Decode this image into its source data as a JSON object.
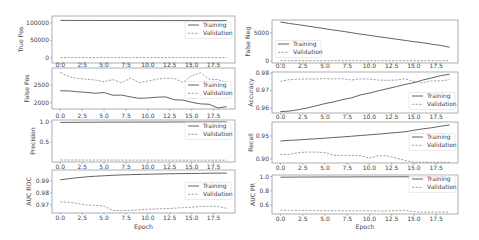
{
  "figure": {
    "colors": {
      "training": "#3a3a3a",
      "validation": "#8a8a8a"
    },
    "xlabel": "Epoch"
  },
  "chart_data": [
    {
      "type": "line",
      "title": "",
      "ylabel": "True Pos",
      "xlabel": "",
      "x": [
        0,
        1,
        2,
        3,
        4,
        5,
        6,
        7,
        8,
        9,
        10,
        11,
        12,
        13,
        14,
        15,
        16,
        17,
        18,
        19
      ],
      "xticks": [
        0,
        2.5,
        5,
        7.5,
        10,
        12.5,
        15,
        17.5
      ],
      "xtick_labels": [
        "0.0",
        "2.5",
        "5.0",
        "7.5",
        "10.0",
        "12.5",
        "15.0",
        "17.5"
      ],
      "yticks": [
        0,
        50000,
        100000
      ],
      "ytick_labels": [
        "0",
        "50000",
        "100000"
      ],
      "xlim": [
        -0.95,
        19.95
      ],
      "ylim": [
        -14300,
        120000
      ],
      "grid": false,
      "legend": {
        "position": "upper right",
        "entries": [
          "Training",
          "Validation"
        ]
      },
      "series": [
        {
          "name": "Training",
          "style": "solid",
          "values": [
            107500,
            107400,
            107300,
            107300,
            107200,
            107200,
            107100,
            107100,
            107100,
            107000,
            107000,
            107000,
            106900,
            106900,
            106900,
            106900,
            106800,
            106800,
            106800,
            106800
          ]
        },
        {
          "name": "Validation",
          "style": "dashed",
          "values": [
            1200,
            1200,
            1200,
            1200,
            1200,
            1200,
            1200,
            1200,
            1200,
            1200,
            1200,
            1200,
            1200,
            1200,
            1200,
            1200,
            1200,
            1200,
            1200,
            1200
          ]
        }
      ]
    },
    {
      "type": "line",
      "title": "",
      "ylabel": "False Neg",
      "xlabel": "",
      "x": [
        0,
        1,
        2,
        3,
        4,
        5,
        6,
        7,
        8,
        9,
        10,
        11,
        12,
        13,
        14,
        15,
        16,
        17,
        18,
        19
      ],
      "xticks": [
        0,
        2.5,
        5,
        7.5,
        10,
        12.5,
        15,
        17.5
      ],
      "xtick_labels": [
        "0.0",
        "2.5",
        "5.0",
        "7.5",
        "10.0",
        "12.5",
        "15.0",
        "17.5"
      ],
      "yticks": [
        0,
        5000
      ],
      "ytick_labels": [
        "0",
        "5000"
      ],
      "xlim": [
        -0.95,
        19.95
      ],
      "ylim": [
        -360,
        7320
      ],
      "grid": false,
      "legend": {
        "position": "lower left",
        "entries": [
          "Training",
          "Validation"
        ]
      },
      "series": [
        {
          "name": "Training",
          "style": "solid",
          "values": [
            6960,
            6700,
            6480,
            6250,
            6000,
            5760,
            5520,
            5300,
            5050,
            4800,
            4580,
            4340,
            4120,
            3900,
            3680,
            3450,
            3250,
            3000,
            2780,
            2450
          ]
        },
        {
          "name": "Validation",
          "style": "dashed",
          "values": [
            60,
            58,
            56,
            55,
            54,
            53,
            52,
            52,
            51,
            50,
            50,
            50,
            49,
            49,
            48,
            48,
            48,
            47,
            47,
            47
          ]
        }
      ]
    },
    {
      "type": "line",
      "title": "",
      "ylabel": "False Pos",
      "xlabel": "",
      "x": [
        0,
        1,
        2,
        3,
        4,
        5,
        6,
        7,
        8,
        9,
        10,
        11,
        12,
        13,
        14,
        15,
        16,
        17,
        18,
        19
      ],
      "xticks": [
        0,
        2.5,
        5,
        7.5,
        10,
        12.5,
        15,
        17.5
      ],
      "xtick_labels": [
        "0.0",
        "2.5",
        "5.0",
        "7.5",
        "10.0",
        "12.5",
        "15.0",
        "17.5"
      ],
      "yticks": [
        2000,
        2500
      ],
      "ytick_labels": [
        "2000",
        "2500"
      ],
      "xlim": [
        -0.95,
        19.95
      ],
      "ylim": [
        1833,
        2972
      ],
      "grid": false,
      "legend": {
        "position": "center right",
        "entries": [
          "Training",
          "Validation"
        ]
      },
      "series": [
        {
          "name": "Training",
          "style": "solid",
          "values": [
            2340,
            2335,
            2310,
            2295,
            2270,
            2290,
            2215,
            2220,
            2170,
            2130,
            2140,
            2160,
            2170,
            2090,
            2080,
            2020,
            1975,
            1965,
            1860,
            1900
          ]
        },
        {
          "name": "Validation",
          "style": "dashed",
          "values": [
            2850,
            2730,
            2680,
            2660,
            2640,
            2590,
            2650,
            2560,
            2690,
            2570,
            2610,
            2660,
            2690,
            2680,
            2570,
            2760,
            2840,
            2660,
            2650,
            2570
          ]
        }
      ]
    },
    {
      "type": "line",
      "title": "",
      "ylabel": "Accuracy",
      "xlabel": "",
      "x": [
        0,
        1,
        2,
        3,
        4,
        5,
        6,
        7,
        8,
        9,
        10,
        11,
        12,
        13,
        14,
        15,
        16,
        17,
        18,
        19
      ],
      "xticks": [
        0,
        2.5,
        5,
        7.5,
        10,
        12.5,
        15,
        17.5
      ],
      "xtick_labels": [
        "0.0",
        "2.5",
        "5.0",
        "7.5",
        "10.0",
        "12.5",
        "15.0",
        "17.5"
      ],
      "yticks": [
        0.96,
        0.97,
        0.98
      ],
      "ytick_labels": [
        "0.96",
        "0.97",
        "0.98"
      ],
      "xlim": [
        -0.95,
        19.95
      ],
      "ylim": [
        0.9571,
        0.9806
      ],
      "grid": false,
      "legend": {
        "position": "lower right",
        "entries": [
          "Training",
          "Validation"
        ]
      },
      "series": [
        {
          "name": "Training",
          "style": "solid",
          "values": [
            0.9579,
            0.9582,
            0.959,
            0.96,
            0.9612,
            0.9625,
            0.9635,
            0.9648,
            0.9658,
            0.9675,
            0.9685,
            0.9698,
            0.971,
            0.9722,
            0.9735,
            0.9745,
            0.976,
            0.9772,
            0.9785,
            0.9793
          ]
        },
        {
          "name": "Validation",
          "style": "dashed",
          "values": [
            0.9753,
            0.9762,
            0.9765,
            0.9766,
            0.9766,
            0.9768,
            0.9766,
            0.9768,
            0.976,
            0.9767,
            0.9765,
            0.976,
            0.9758,
            0.976,
            0.9767,
            0.9752,
            0.9745,
            0.9755,
            0.9755,
            0.9762
          ]
        }
      ]
    },
    {
      "type": "line",
      "title": "",
      "ylabel": "Precision",
      "xlabel": "",
      "x": [
        0,
        1,
        2,
        3,
        4,
        5,
        6,
        7,
        8,
        9,
        10,
        11,
        12,
        13,
        14,
        15,
        16,
        17,
        18,
        19
      ],
      "xticks": [
        0,
        2.5,
        5,
        7.5,
        10,
        12.5,
        15,
        17.5
      ],
      "xtick_labels": [
        "0.0",
        "2.5",
        "5.0",
        "7.5",
        "10.0",
        "12.5",
        "15.0",
        "17.5"
      ],
      "yticks": [
        0.5,
        1.0
      ],
      "ytick_labels": [
        "0.5",
        "1.0"
      ],
      "xlim": [
        -0.95,
        19.95
      ],
      "ylim": [
        0.0025,
        1.0475
      ],
      "grid": false,
      "legend": {
        "position": "upper right",
        "entries": [
          "Training",
          "Validation"
        ]
      },
      "series": [
        {
          "name": "Training",
          "style": "solid",
          "values": [
            0.986,
            0.989,
            0.991,
            0.992,
            0.993,
            0.994,
            0.995,
            0.995,
            0.996,
            0.996,
            0.997,
            0.997,
            0.997,
            0.998,
            0.998,
            0.998,
            0.998,
            0.999,
            0.999,
            0.999
          ]
        },
        {
          "name": "Validation",
          "style": "dashed",
          "values": [
            0.053,
            0.052,
            0.052,
            0.051,
            0.051,
            0.05,
            0.05,
            0.05,
            0.05,
            0.049,
            0.049,
            0.05,
            0.049,
            0.049,
            0.048,
            0.048,
            0.048,
            0.048,
            0.048,
            0.048
          ]
        }
      ]
    },
    {
      "type": "line",
      "title": "",
      "ylabel": "Recall",
      "xlabel": "",
      "x": [
        0,
        1,
        2,
        3,
        4,
        5,
        6,
        7,
        8,
        9,
        10,
        11,
        12,
        13,
        14,
        15,
        16,
        17,
        18,
        19
      ],
      "xticks": [
        0,
        2.5,
        5,
        7.5,
        10,
        12.5,
        15,
        17.5
      ],
      "xtick_labels": [
        "0.0",
        "2.5",
        "5.0",
        "7.5",
        "10.0",
        "12.5",
        "15.0",
        "17.5"
      ],
      "yticks": [
        0.9,
        0.95
      ],
      "ytick_labels": [
        "0.90",
        "0.95"
      ],
      "xlim": [
        -0.95,
        19.95
      ],
      "ylim": [
        0.8913,
        0.9804
      ],
      "grid": false,
      "legend": {
        "position": "center right",
        "entries": [
          "Training",
          "Validation"
        ]
      },
      "series": [
        {
          "name": "Training",
          "style": "solid",
          "values": [
            0.9391,
            0.9405,
            0.9415,
            0.9428,
            0.944,
            0.9452,
            0.9468,
            0.948,
            0.9495,
            0.951,
            0.9525,
            0.954,
            0.9558,
            0.9575,
            0.959,
            0.9625,
            0.9655,
            0.968,
            0.9712,
            0.9739
          ]
        },
        {
          "name": "Validation",
          "style": "dashed",
          "values": [
            0.91,
            0.91,
            0.914,
            0.915,
            0.915,
            0.914,
            0.908,
            0.908,
            0.908,
            0.907,
            0.902,
            0.907,
            0.907,
            0.902,
            0.897,
            0.893,
            0.893,
            0.893,
            0.893,
            0.893
          ]
        }
      ]
    },
    {
      "type": "line",
      "title": "",
      "ylabel": "AUC ROC",
      "xlabel": "Epoch",
      "x": [
        0,
        1,
        2,
        3,
        4,
        5,
        6,
        7,
        8,
        9,
        10,
        11,
        12,
        13,
        14,
        15,
        16,
        17,
        18,
        19
      ],
      "xticks": [
        0,
        2.5,
        5,
        7.5,
        10,
        12.5,
        15,
        17.5
      ],
      "xtick_labels": [
        "0.0",
        "2.5",
        "5.0",
        "7.5",
        "10.0",
        "12.5",
        "15.0",
        "17.5"
      ],
      "yticks": [
        0.97,
        0.98,
        0.99
      ],
      "ytick_labels": [
        "0.97",
        "0.98",
        "0.99"
      ],
      "xlim": [
        -0.95,
        19.95
      ],
      "ylim": [
        0.9633,
        0.9992
      ],
      "grid": false,
      "legend": {
        "position": "center right",
        "entries": [
          "Training",
          "Validation"
        ]
      },
      "series": [
        {
          "name": "Training",
          "style": "solid",
          "values": [
            0.991,
            0.992,
            0.9928,
            0.9935,
            0.994,
            0.9944,
            0.9948,
            0.9951,
            0.9953,
            0.9955,
            0.9957,
            0.9958,
            0.996,
            0.9961,
            0.9962,
            0.9963,
            0.9964,
            0.9965,
            0.9966,
            0.9966
          ]
        },
        {
          "name": "Validation",
          "style": "dashed",
          "values": [
            0.9725,
            0.9723,
            0.9712,
            0.97,
            0.9697,
            0.969,
            0.9655,
            0.9652,
            0.9655,
            0.966,
            0.9665,
            0.9667,
            0.967,
            0.9673,
            0.9678,
            0.9682,
            0.9687,
            0.969,
            0.9688,
            0.9672
          ]
        }
      ]
    },
    {
      "type": "line",
      "title": "",
      "ylabel": "AUC PR",
      "xlabel": "Epoch",
      "x": [
        0,
        1,
        2,
        3,
        4,
        5,
        6,
        7,
        8,
        9,
        10,
        11,
        12,
        13,
        14,
        15,
        16,
        17,
        18,
        19
      ],
      "xticks": [
        0,
        2.5,
        5,
        7.5,
        10,
        12.5,
        15,
        17.5
      ],
      "xtick_labels": [
        "0.0",
        "2.5",
        "5.0",
        "7.5",
        "10.0",
        "12.5",
        "15.0",
        "17.5"
      ],
      "yticks": [
        0.6,
        0.8,
        1.0
      ],
      "ytick_labels": [
        "0.6",
        "0.8",
        "1.0"
      ],
      "xlim": [
        -0.95,
        19.95
      ],
      "ylim": [
        0.472,
        1.023
      ],
      "grid": false,
      "legend": {
        "position": "upper right",
        "entries": [
          "Training",
          "Validation"
        ]
      },
      "series": [
        {
          "name": "Training",
          "style": "solid",
          "values": [
            0.992,
            0.993,
            0.994,
            0.994,
            0.995,
            0.995,
            0.996,
            0.996,
            0.996,
            0.997,
            0.997,
            0.997,
            0.997,
            0.998,
            0.998,
            0.998,
            0.998,
            0.998,
            0.998,
            0.998
          ]
        },
        {
          "name": "Validation",
          "style": "dashed",
          "values": [
            0.525,
            0.525,
            0.523,
            0.522,
            0.52,
            0.519,
            0.518,
            0.517,
            0.517,
            0.517,
            0.516,
            0.515,
            0.515,
            0.52,
            0.525,
            0.505,
            0.497,
            0.5,
            0.5,
            0.5
          ]
        }
      ]
    }
  ]
}
